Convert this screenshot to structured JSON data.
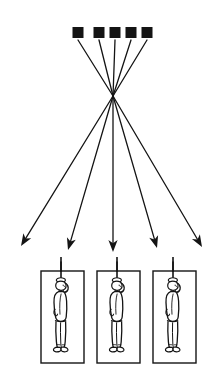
{
  "figure": {
    "title": "Pinhole projection diagram: five sources converge to a point and diverge onto three framed hanging figures",
    "background_color": "#ffffff",
    "ink_color": "#111111",
    "width": 222,
    "height": 380
  },
  "sources": {
    "label": "source-squares",
    "count": 5,
    "shape": "filled-square",
    "fill_color": "#141414",
    "size": 11,
    "top_y": 27,
    "centers_x": [
      78,
      99,
      115,
      131,
      147
    ]
  },
  "convergence": {
    "label": "crossing-point",
    "x": 113,
    "y": 96,
    "description": "pinhole node where all rays cross"
  },
  "rays": {
    "label": "projection-rays",
    "count": 5,
    "stroke_color": "#141414",
    "stroke_width": 1.3,
    "incoming": [
      {
        "from_x": 78,
        "from_y": 40,
        "to_x": 113,
        "to_y": 96
      },
      {
        "from_x": 99,
        "from_y": 40,
        "to_x": 113,
        "to_y": 96
      },
      {
        "from_x": 115,
        "from_y": 40,
        "to_x": 113,
        "to_y": 96
      },
      {
        "from_x": 131,
        "from_y": 40,
        "to_x": 113,
        "to_y": 96
      },
      {
        "from_x": 147,
        "from_y": 40,
        "to_x": 113,
        "to_y": 96
      }
    ],
    "outgoing": [
      {
        "from_x": 113,
        "from_y": 96,
        "to_x": 21,
        "to_y": 246,
        "arrow": true
      },
      {
        "from_x": 113,
        "from_y": 96,
        "to_x": 68,
        "to_y": 250,
        "arrow": true
      },
      {
        "from_x": 113,
        "from_y": 96,
        "to_x": 113,
        "to_y": 252,
        "arrow": true
      },
      {
        "from_x": 113,
        "from_y": 96,
        "to_x": 157,
        "to_y": 248,
        "arrow": true
      },
      {
        "from_x": 113,
        "from_y": 96,
        "to_x": 202,
        "to_y": 247,
        "arrow": true
      }
    ]
  },
  "image_panels": {
    "label": "projected-image-frames",
    "count": 3,
    "stroke_color": "#141414",
    "stroke_width": 1.4,
    "frame_width": 43,
    "frame_height": 92,
    "top_y": 271,
    "lefts_x": [
      41,
      97,
      153
    ],
    "panels": [
      {
        "index": 1,
        "x": 41,
        "y": 271,
        "figure": "hanging-person",
        "rope_x": 61,
        "rope_top_y": 257
      },
      {
        "index": 2,
        "x": 97,
        "y": 271,
        "figure": "hanging-person",
        "rope_x": 117,
        "rope_top_y": 257
      },
      {
        "index": 3,
        "x": 153,
        "y": 271,
        "figure": "hanging-person",
        "rope_x": 173,
        "rope_top_y": 257
      }
    ]
  },
  "figure_subject": {
    "label": "hanging-person",
    "description": "standing human silhouette suspended by a rope at the neck, one arm raised toward the head, facing right",
    "outline_color": "#141414",
    "fill_color": "#ffffff"
  }
}
